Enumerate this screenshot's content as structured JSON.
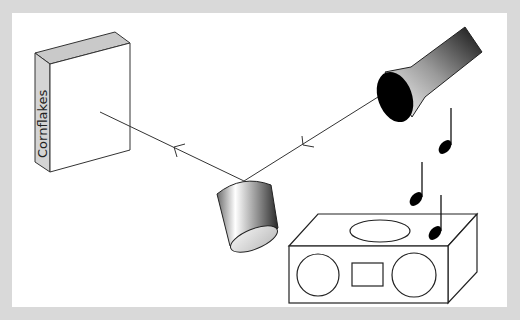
{
  "diagram": {
    "type": "optics-reflection-illustration",
    "objects": [
      {
        "id": "cereal-box",
        "label": "Cornflakes"
      },
      {
        "id": "flashlight"
      },
      {
        "id": "mirror-cup"
      },
      {
        "id": "radio"
      },
      {
        "id": "music-notes",
        "count": 3
      }
    ],
    "rays": [
      {
        "from": "flashlight",
        "to": "mirror-cup"
      },
      {
        "from": "mirror-cup",
        "to": "cereal-box"
      }
    ]
  },
  "colors": {
    "frame": "#d9d9d9",
    "background": "#ffffff",
    "stroke": "#333333",
    "box_side": "#cfcfcf",
    "box_top": "#c8c8c8"
  }
}
